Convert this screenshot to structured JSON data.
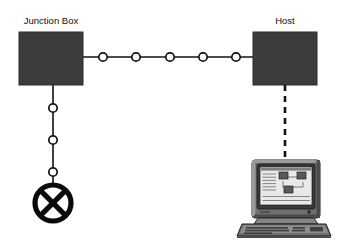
{
  "diagram": {
    "background_color": "#ffffff",
    "canvas": {
      "width": 344,
      "height": 252
    },
    "colors": {
      "box_fill": "#3c3c3c",
      "line": "#121212",
      "node_fill": "#ffffff",
      "terminator": "#0a0a0a",
      "label_text": "#111111",
      "monitor_case": "#6f6f6f",
      "monitor_screen": "#e9e9e9"
    },
    "nodes": [
      {
        "id": "junction-box",
        "label": "Junction Box",
        "shape": "rectangle",
        "x": 19,
        "y": 32,
        "width": 64,
        "height": 53,
        "label_x": 51,
        "label_y": 24
      },
      {
        "id": "host",
        "label": "Host",
        "shape": "rectangle",
        "x": 253,
        "y": 32,
        "width": 64,
        "height": 53,
        "label_x": 285,
        "label_y": 24
      },
      {
        "id": "terminator",
        "label": "",
        "shape": "circled-x-terminator",
        "cx": 53,
        "cy": 203,
        "r": 18
      },
      {
        "id": "workstation",
        "label": "",
        "shape": "computer-workstation",
        "x": 240,
        "y": 158,
        "width": 92,
        "height": 78
      }
    ],
    "links": [
      {
        "id": "trunk-bus",
        "from": "junction-box",
        "to": "host",
        "style": "solid",
        "orientation": "horizontal",
        "x1": 83,
        "y1": 57,
        "x2": 253,
        "y2": 57,
        "tap_count": 5,
        "taps": [
          {
            "cx": 103,
            "cy": 57,
            "r": 4.2
          },
          {
            "cx": 136,
            "cy": 57,
            "r": 4.2
          },
          {
            "cx": 170,
            "cy": 57,
            "r": 4.2
          },
          {
            "cx": 203,
            "cy": 57,
            "r": 4.2
          },
          {
            "cx": 236,
            "cy": 57,
            "r": 4.2
          }
        ]
      },
      {
        "id": "drop-cable",
        "from": "junction-box",
        "to": "terminator",
        "style": "solid",
        "orientation": "vertical",
        "x1": 53,
        "y1": 85,
        "x2": 53,
        "y2": 185,
        "tap_count": 3,
        "taps": [
          {
            "cx": 53,
            "cy": 108,
            "r": 4.2
          },
          {
            "cx": 53,
            "cy": 140,
            "r": 4.2
          },
          {
            "cx": 53,
            "cy": 172,
            "r": 4.2
          }
        ]
      },
      {
        "id": "host-workstation-link",
        "from": "host",
        "to": "workstation",
        "style": "dashed",
        "orientation": "vertical",
        "x1": 285,
        "y1": 85,
        "x2": 285,
        "y2": 160,
        "tap_count": 0,
        "taps": []
      }
    ],
    "workstation_screen": {
      "text_lines": 7,
      "diagram_boxes": 3,
      "has_connectors": true
    }
  }
}
